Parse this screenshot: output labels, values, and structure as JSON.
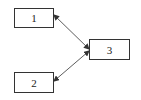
{
  "diagram": {
    "nodes": [
      {
        "id": "1",
        "label": "1"
      },
      {
        "id": "2",
        "label": "2"
      },
      {
        "id": "3",
        "label": "3"
      }
    ],
    "edges": [
      {
        "from": "3",
        "to": "1",
        "bidirectional": true
      },
      {
        "from": "3",
        "to": "2",
        "bidirectional": true
      }
    ],
    "colors": {
      "stroke": "#333333",
      "background": "#ffffff"
    }
  }
}
